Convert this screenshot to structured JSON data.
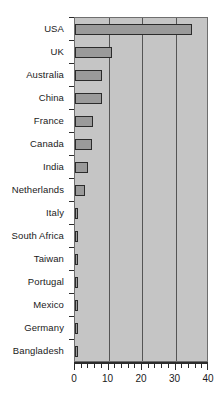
{
  "chart_data": {
    "type": "bar",
    "orientation": "horizontal",
    "title": "",
    "xlabel": "",
    "ylabel": "",
    "xlim": [
      0,
      40
    ],
    "ylim": null,
    "grid": true,
    "legend": null,
    "xticks": [
      0,
      10,
      20,
      30,
      40
    ],
    "xtick_labels": [
      "0",
      "10",
      "20",
      "30",
      "40"
    ],
    "xminor_tick_step": 2,
    "gridlines_at": [
      10,
      20,
      30
    ],
    "categories": [
      "USA",
      "UK",
      "Australia",
      "China",
      "France",
      "Canada",
      "India",
      "Netherlands",
      "Italy",
      "South Africa",
      "Taiwan",
      "Portugal",
      "Mexico",
      "Germany",
      "Bangladesh"
    ],
    "values": [
      35,
      11,
      8,
      8,
      5.5,
      5,
      4,
      3,
      0.8,
      0.8,
      0.8,
      0.8,
      0.8,
      0.8,
      0.8
    ]
  },
  "style": {
    "plot_background": "#c5c5c5",
    "bar_fill": "#9a9a9a",
    "bar_edge": "#2b2b2b",
    "gridline_color": "#555555",
    "axis_color": "#2b2b2b",
    "text_color": "#1a1a1a",
    "page_background": "#ffffff"
  }
}
